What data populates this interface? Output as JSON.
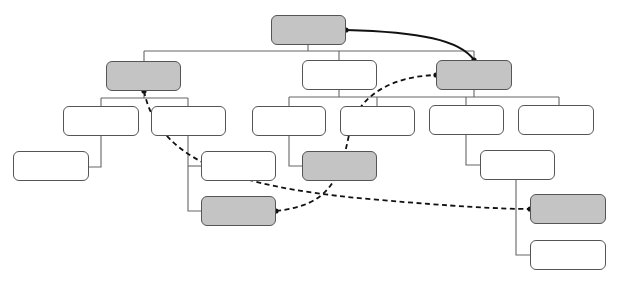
{
  "diagram": {
    "type": "tree-with-cross-links",
    "colors": {
      "node_fill": "#ffffff",
      "shaded_fill": "#c4c4c4",
      "border": "#555555",
      "connector": "#666666",
      "link": "#111111"
    },
    "nodes": [
      {
        "id": "root",
        "x": 271,
        "y": 15,
        "w": 75,
        "h": 30,
        "shaded": true,
        "label": ""
      },
      {
        "id": "a",
        "x": 106,
        "y": 61,
        "w": 75,
        "h": 30,
        "shaded": true,
        "label": ""
      },
      {
        "id": "b",
        "x": 302,
        "y": 60,
        "w": 75,
        "h": 30,
        "shaded": false,
        "label": ""
      },
      {
        "id": "c",
        "x": 436,
        "y": 60,
        "w": 76,
        "h": 30,
        "shaded": true,
        "label": ""
      },
      {
        "id": "a1",
        "x": 63,
        "y": 106,
        "w": 76,
        "h": 30,
        "shaded": false,
        "label": ""
      },
      {
        "id": "a2",
        "x": 151,
        "y": 106,
        "w": 75,
        "h": 30,
        "shaded": false,
        "label": ""
      },
      {
        "id": "a1a",
        "x": 13,
        "y": 151,
        "w": 76,
        "h": 30,
        "shaded": false,
        "label": ""
      },
      {
        "id": "a2a",
        "x": 201,
        "y": 151,
        "w": 75,
        "h": 30,
        "shaded": false,
        "label": ""
      },
      {
        "id": "a2b",
        "x": 201,
        "y": 196,
        "w": 75,
        "h": 30,
        "shaded": true,
        "label": ""
      },
      {
        "id": "b1",
        "x": 252,
        "y": 106,
        "w": 74,
        "h": 30,
        "shaded": false,
        "label": ""
      },
      {
        "id": "b2",
        "x": 340,
        "y": 106,
        "w": 75,
        "h": 30,
        "shaded": false,
        "label": ""
      },
      {
        "id": "b1a",
        "x": 302,
        "y": 151,
        "w": 75,
        "h": 30,
        "shaded": true,
        "label": ""
      },
      {
        "id": "c1",
        "x": 429,
        "y": 105,
        "w": 75,
        "h": 30,
        "shaded": false,
        "label": ""
      },
      {
        "id": "c2",
        "x": 518,
        "y": 105,
        "w": 76,
        "h": 30,
        "shaded": false,
        "label": ""
      },
      {
        "id": "c1a",
        "x": 480,
        "y": 150,
        "w": 75,
        "h": 30,
        "shaded": false,
        "label": ""
      },
      {
        "id": "c1b",
        "x": 530,
        "y": 194,
        "w": 76,
        "h": 30,
        "shaded": true,
        "label": ""
      },
      {
        "id": "c1c",
        "x": 530,
        "y": 240,
        "w": 76,
        "h": 30,
        "shaded": false,
        "label": ""
      }
    ],
    "connectors": [
      "M308,45 V51",
      "M144,51 H474",
      "M144,51 V61",
      "M339,51 V60",
      "M474,51 V60",
      "M144,91 V98",
      "M101,98 H188",
      "M101,98 V106",
      "M188,98 V106",
      "M101,136 V167 H89",
      "M188,136 V211 H201",
      "M188,166 H201",
      "M339,90 V97",
      "M289,97 H559",
      "M289,97 V106",
      "M377,97 V106",
      "M474,90 V97",
      "M466,97 V105",
      "M559,97 V105",
      "M289,136 V166 H302",
      "M466,135 V165 H480",
      "M516,180 V255 H530"
    ],
    "links": [
      {
        "from": "root",
        "to": "c",
        "style": "solid",
        "path": "M346,30 C420,32 460,40 474,60",
        "dots": [
          [
            346,
            30
          ],
          [
            474,
            60
          ]
        ]
      },
      {
        "from": "a",
        "to": "c1b",
        "style": "dashed",
        "path": "M144,91 C160,170 260,190 380,200 C450,206 500,209 530,209",
        "dots": [
          [
            144,
            91
          ],
          [
            530,
            209
          ]
        ]
      },
      {
        "from": "a2b",
        "to": "c",
        "style": "dashed",
        "path": "M276,211 C330,205 340,180 350,130 C360,90 400,76 436,75",
        "dots": [
          [
            276,
            211
          ],
          [
            436,
            75
          ]
        ]
      }
    ]
  }
}
